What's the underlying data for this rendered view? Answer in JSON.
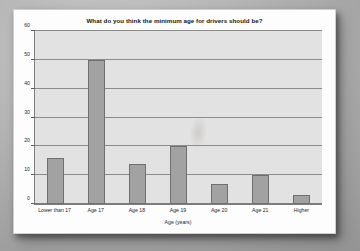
{
  "chart_data": {
    "type": "bar",
    "title": "What do you think the minimum age for drivers should be?",
    "xlabel": "Age (years)",
    "ylabel": "Number of people",
    "categories": [
      "Lower than 17",
      "Age 17",
      "Age 18",
      "Age 19",
      "Age 20",
      "Age 21",
      "Higher"
    ],
    "values": [
      16,
      50,
      14,
      20,
      7,
      10,
      3
    ],
    "ylim": [
      0,
      60
    ],
    "ytick_step": 10,
    "yticks": [
      0,
      10,
      20,
      30,
      40,
      50,
      60
    ],
    "ytick_labels": [
      "0",
      "10",
      "20",
      "30",
      "40",
      "50",
      "60"
    ],
    "grid": "horizontal",
    "legend": "none",
    "colors": {
      "bar_fill": "#a2a2a2",
      "bar_border": "#6f6f6f",
      "plot_background": "#e2e2e2",
      "gridline": "#8c8c8c",
      "axis": "#7d7d7d",
      "card_background": "#fdfdfd",
      "page_background": "#a8a8a8",
      "text": "#1f1f1f"
    }
  }
}
